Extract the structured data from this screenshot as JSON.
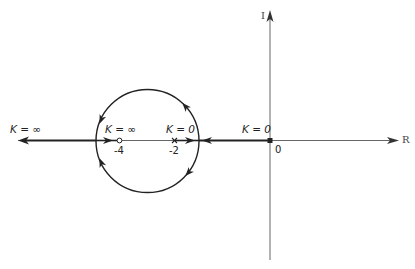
{
  "diagram": {
    "type": "root-locus",
    "axes": {
      "real_label": "R",
      "imag_label": "I",
      "origin_label": "0"
    },
    "points": {
      "zero": {
        "value": -4,
        "label": "-4",
        "marker": "o"
      },
      "pole_a": {
        "value": -2,
        "label": "-2",
        "marker": "x"
      },
      "pole_b": {
        "value": 0,
        "label": "0",
        "marker": "x"
      }
    },
    "gain_labels": {
      "left_infinity": "K = ∞",
      "zero_infinity": "K = ∞",
      "pole_a_zero": "K = 0",
      "pole_b_zero": "K = 0"
    },
    "locus": {
      "circle": {
        "center_approx": -3,
        "description": "Circular locus around zero at -4 between breakaway and break-in points"
      },
      "real_axis_segments": [
        "from -2 rightward to breakaway point",
        "from 0 leftward to breakaway point",
        "from break-in point leftward to -infinity",
        "from break-in point rightward to zero at -4"
      ]
    },
    "colors": {
      "line": "#222222",
      "axis": "#555555",
      "background": "#ffffff"
    }
  }
}
